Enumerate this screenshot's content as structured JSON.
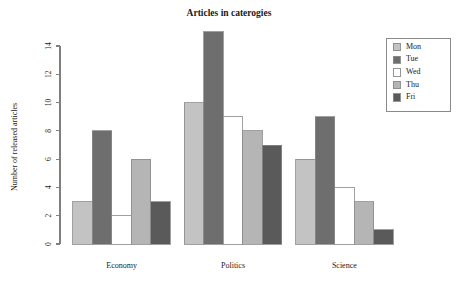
{
  "chart_data": {
    "type": "bar",
    "title": "Articles in caterogies",
    "xlabel": "",
    "ylabel": "Number of released articles",
    "categories": [
      "Economy",
      "Politics",
      "Science"
    ],
    "series": [
      {
        "name": "Mon",
        "color": "#c3c3c3",
        "values": [
          3,
          10,
          6
        ]
      },
      {
        "name": "Tue",
        "color": "#6e6e6e",
        "values": [
          8,
          15,
          9
        ]
      },
      {
        "name": "Wed",
        "color": "#ffffff",
        "values": [
          2,
          9,
          4
        ]
      },
      {
        "name": "Thu",
        "color": "#b5b5b5",
        "values": [
          6,
          8,
          3
        ]
      },
      {
        "name": "Fri",
        "color": "#5a5a5a",
        "values": [
          3,
          7,
          1
        ]
      }
    ],
    "ylim": [
      0,
      15
    ],
    "yticks": [
      0,
      2,
      4,
      6,
      8,
      10,
      12,
      14
    ],
    "ytick_labels": [
      "0",
      "2",
      "4",
      "6",
      "8",
      "10",
      "12",
      "14"
    ],
    "grid": false,
    "legend": {
      "position": "top-right",
      "entries": [
        "Mon",
        "Tue",
        "Wed",
        "Thu",
        "Fri"
      ]
    },
    "axis_color": "#808080",
    "bar_border_color": "#8a8a8a",
    "text_color": "#1a1a1a",
    "background": "#ffffff"
  }
}
